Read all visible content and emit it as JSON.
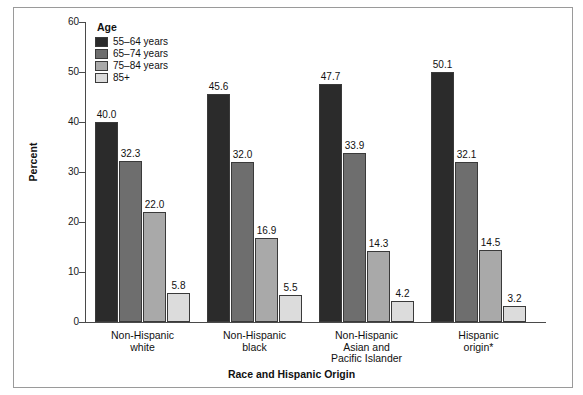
{
  "chart_data": {
    "type": "bar",
    "title": "",
    "xlabel": "Race and Hispanic Origin",
    "ylabel": "Percent",
    "ylim": [
      0,
      60
    ],
    "yticks": [
      0,
      10,
      20,
      30,
      40,
      50,
      60
    ],
    "grid": false,
    "legend_position": "top-left",
    "legend_title": "Age",
    "categories": [
      "Non-Hispanic\nwhite",
      "Non-Hispanic\nblack",
      "Non-Hispanic\nAsian and\nPacific Islander",
      "Hispanic\norigin*"
    ],
    "series": [
      {
        "name": "55–64 years",
        "color": "#2b2b2b",
        "values": [
          40.0,
          45.6,
          47.7,
          50.1
        ]
      },
      {
        "name": "65–74 years",
        "color": "#6e6e6e",
        "values": [
          32.3,
          32.0,
          33.9,
          32.1
        ]
      },
      {
        "name": "75–84 years",
        "color": "#a9a9a9",
        "values": [
          22.0,
          16.9,
          14.3,
          14.5
        ]
      },
      {
        "name": "85+",
        "color": "#dcdcdc",
        "values": [
          5.8,
          5.5,
          4.2,
          3.2
        ]
      }
    ],
    "value_labels": [
      [
        "40.0",
        "32.3",
        "22.0",
        "5.8"
      ],
      [
        "45.6",
        "32.0",
        "16.9",
        "5.5"
      ],
      [
        "47.7",
        "33.9",
        "14.3",
        "4.2"
      ],
      [
        "50.1",
        "32.1",
        "14.5",
        "3.2"
      ]
    ],
    "footnote_marker": "*"
  },
  "axis": {
    "y_title": "Percent",
    "x_title": "Race and Hispanic Origin",
    "y_labels": [
      "60",
      "50",
      "40",
      "30",
      "20",
      "10",
      "0"
    ]
  },
  "legend": {
    "title": "Age",
    "items": [
      {
        "label": "55–64 years",
        "color": "#2b2b2b"
      },
      {
        "label": "65–74 years",
        "color": "#6e6e6e"
      },
      {
        "label": "75–84 years",
        "color": "#a9a9a9"
      },
      {
        "label": "85+",
        "color": "#dcdcdc"
      }
    ]
  },
  "groups": [
    {
      "label": "Non-Hispanic\nwhite",
      "bars": [
        {
          "series": "55–64 years",
          "value": 40.0,
          "label": "40.0",
          "color": "#2b2b2b"
        },
        {
          "series": "65–74 years",
          "value": 32.3,
          "label": "32.3",
          "color": "#6e6e6e"
        },
        {
          "series": "75–84 years",
          "value": 22.0,
          "label": "22.0",
          "color": "#a9a9a9"
        },
        {
          "series": "85+",
          "value": 5.8,
          "label": "5.8",
          "color": "#dcdcdc"
        }
      ]
    },
    {
      "label": "Non-Hispanic\nblack",
      "bars": [
        {
          "series": "55–64 years",
          "value": 45.6,
          "label": "45.6",
          "color": "#2b2b2b"
        },
        {
          "series": "65–74 years",
          "value": 32.0,
          "label": "32.0",
          "color": "#6e6e6e"
        },
        {
          "series": "75–84 years",
          "value": 16.9,
          "label": "16.9",
          "color": "#a9a9a9"
        },
        {
          "series": "85+",
          "value": 5.5,
          "label": "5.5",
          "color": "#dcdcdc"
        }
      ]
    },
    {
      "label": "Non-Hispanic\nAsian and\nPacific Islander",
      "bars": [
        {
          "series": "55–64 years",
          "value": 47.7,
          "label": "47.7",
          "color": "#2b2b2b"
        },
        {
          "series": "65–74 years",
          "value": 33.9,
          "label": "33.9",
          "color": "#6e6e6e"
        },
        {
          "series": "75–84 years",
          "value": 14.3,
          "label": "14.3",
          "color": "#a9a9a9"
        },
        {
          "series": "85+",
          "value": 4.2,
          "label": "4.2",
          "color": "#dcdcdc"
        }
      ]
    },
    {
      "label": "Hispanic\norigin*",
      "bars": [
        {
          "series": "55–64 years",
          "value": 50.1,
          "label": "50.1",
          "color": "#2b2b2b"
        },
        {
          "series": "65–74 years",
          "value": 32.1,
          "label": "32.1",
          "color": "#6e6e6e"
        },
        {
          "series": "75–84 years",
          "value": 14.5,
          "label": "14.5",
          "color": "#a9a9a9"
        },
        {
          "series": "85+",
          "value": 3.2,
          "label": "3.2",
          "color": "#dcdcdc"
        }
      ]
    }
  ]
}
